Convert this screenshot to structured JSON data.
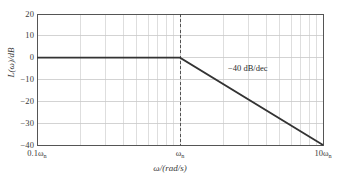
{
  "chart_data": {
    "type": "line",
    "title": "",
    "xlabel": "ω/(rad/s)",
    "ylabel": "L(ω)/dB",
    "xscale": "log",
    "xlim_decades": [
      -1,
      1
    ],
    "ylim": [
      -40,
      20
    ],
    "ytick_step": 10,
    "grid": true,
    "legend": false,
    "xtick_labels": [
      {
        "text": "0.1ω",
        "sub": "n",
        "decade": -1
      },
      {
        "text": "ω",
        "sub": "n",
        "decade": 0
      },
      {
        "text": "10ω",
        "sub": "n",
        "decade": 1
      }
    ],
    "ytick_labels": [
      "20",
      "10",
      "0",
      "−10",
      "−20",
      "−30",
      "−40"
    ],
    "ytick_values": [
      20,
      10,
      0,
      -10,
      -20,
      -30,
      -40
    ],
    "minor_gridline_mantissas": [
      2,
      3,
      4,
      5,
      6,
      7,
      8,
      9
    ],
    "series": [
      {
        "name": "asymptotic magnitude",
        "points": [
          {
            "decade": -1,
            "db": 0
          },
          {
            "decade": 0,
            "db": 0
          },
          {
            "decade": 1,
            "db": -40
          }
        ]
      }
    ],
    "annotations": [
      {
        "name": "slope-label",
        "text": "−40 dB/dec",
        "decade": 0.55,
        "db": -8
      }
    ],
    "markers": [
      {
        "name": "corner-frequency",
        "type": "vertical-dashed",
        "decade": 0,
        "label": "ωn"
      }
    ],
    "colors": {
      "curve": "#333333",
      "frame": "#555555",
      "gridline": "#c8c8c8",
      "dashed_marker": "#444444",
      "text": "#3a3a3a",
      "background": "#ffffff"
    }
  },
  "geometry": {
    "plot_left": 37,
    "plot_right": 323,
    "plot_top": 14,
    "plot_bottom": 145
  }
}
